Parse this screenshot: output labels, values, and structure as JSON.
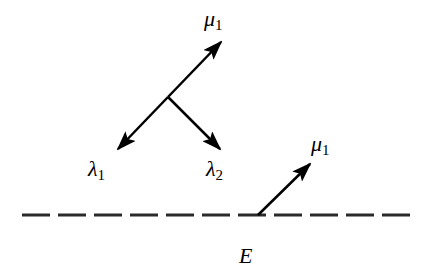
{
  "diagram": {
    "labels": {
      "mu1_top": {
        "symbol": "μ",
        "sub": "1"
      },
      "lambda1": {
        "symbol": "λ",
        "sub": "1"
      },
      "lambda2": {
        "symbol": "λ",
        "sub": "2"
      },
      "mu1_right": {
        "symbol": "μ",
        "sub": "1"
      },
      "E": {
        "symbol": "E",
        "sub": ""
      }
    },
    "colors": {
      "stroke": "#000000",
      "dash": "#2a2a2a",
      "background": "#ffffff"
    }
  }
}
